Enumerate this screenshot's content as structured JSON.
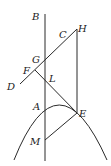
{
  "figure": {
    "type": "geometry-diagram",
    "colors": {
      "line": "#2a2a2a",
      "label": "#222222",
      "background": "#ffffff"
    },
    "points": {
      "B": {
        "label": "B",
        "x": 45,
        "y": 14
      },
      "H": {
        "label": "H",
        "x": 77,
        "y": 29
      },
      "C": {
        "label": "C",
        "x": 64,
        "y": 40
      },
      "G": {
        "label": "G",
        "x": 45,
        "y": 60
      },
      "F": {
        "label": "F",
        "x": 35,
        "y": 70
      },
      "D": {
        "label": "D",
        "x": 20,
        "y": 84
      },
      "L": {
        "label": "L",
        "x": 45,
        "y": 83
      },
      "A": {
        "label": "A",
        "x": 45,
        "y": 107
      },
      "E": {
        "label": "E",
        "x": 77,
        "y": 113
      },
      "M": {
        "label": "M",
        "x": 45,
        "y": 140
      }
    },
    "segments": [
      [
        "B",
        "bottom-axis"
      ],
      [
        "D",
        "H"
      ],
      [
        "H",
        "E"
      ],
      [
        "F",
        "E"
      ],
      [
        "M",
        "E"
      ]
    ],
    "curves": [
      {
        "name": "parabola",
        "through": [
          "A",
          "E"
        ]
      }
    ]
  }
}
